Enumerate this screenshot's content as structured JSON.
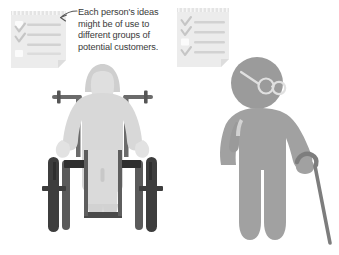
{
  "illustration": {
    "title": "Two people with checklists illustration",
    "background_color": "#ffffff"
  },
  "callout": {
    "text": "Each person's ideas\nmight be of use to\ndifferent groups of\npotential customers.",
    "text_color": "#3a3a3a",
    "arrow_icon": "curved-arrow-left-icon",
    "arrow_target": "left-checklist"
  },
  "checklists": [
    {
      "id": "left-checklist",
      "paper_color": "#ececec",
      "line_color": "#d2d2d2",
      "box_color": "#fbfbfb",
      "check_color": "#c6c6c6",
      "rows": [
        {
          "state": "unchecked",
          "marker": "empty-box"
        },
        {
          "state": "checked",
          "marker": "check-mark"
        },
        {
          "state": "checked",
          "marker": "check-mark"
        },
        {
          "state": "unchecked",
          "marker": "empty-box"
        }
      ]
    },
    {
      "id": "right-checklist",
      "paper_color": "#ececec",
      "line_color": "#d2d2d2",
      "box_color": "#fbfbfb",
      "check_color": "#c6c6c6",
      "rows": [
        {
          "state": "checked",
          "marker": "check-mark"
        },
        {
          "state": "checked",
          "marker": "check-mark"
        },
        {
          "state": "unchecked",
          "marker": "empty-box"
        },
        {
          "state": "checked",
          "marker": "check-mark"
        }
      ]
    }
  ],
  "figures": [
    {
      "id": "wheelchair-user",
      "name": "person-in-wheelchair",
      "body_color": "#d8d8d8",
      "hair_color": "#cfcfcf",
      "face_color": "#dcdcdc",
      "frame_color": "#6b6b6b",
      "wheel_color": "#3d3d3d",
      "accent_color": "#2e2e2e",
      "accessories": [
        "wheelchair",
        "hair",
        "armrests",
        "footplate",
        "wheels"
      ]
    },
    {
      "id": "standing-person-with-cane",
      "name": "person-with-cane",
      "body_color": "#a1a1a1",
      "head_color": "#9b9b9b",
      "cane_color": "#7d7d7d",
      "glasses_color": "#e3e3e3",
      "accessories": [
        "glasses",
        "walking-cane"
      ]
    }
  ]
}
